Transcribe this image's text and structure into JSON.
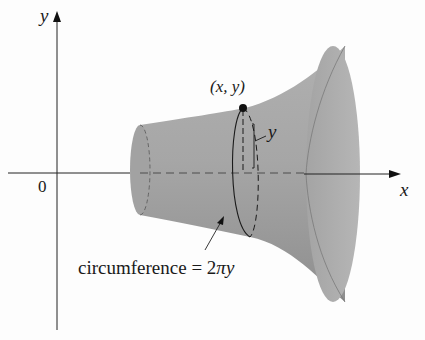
{
  "diagram": {
    "type": "surface-of-revolution",
    "axes": {
      "x_label": "x",
      "y_label": "y",
      "origin_label": "0"
    },
    "point_label": "(x, y)",
    "radius_label": "y",
    "annotation": {
      "text": "circumference = 2πy",
      "prefix": "circumference = 2",
      "pi": "π",
      "suffix": "y"
    },
    "colors": {
      "surface_fill": "#a9a9a9",
      "surface_dark": "#8f8f8f",
      "end_cap": "#b3b3b3",
      "lines": "#222222",
      "background": "#fdfdfd"
    }
  }
}
